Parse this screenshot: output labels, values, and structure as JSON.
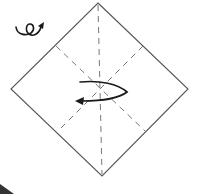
{
  "diagram": {
    "type": "origami-step",
    "paper": {
      "shape": "diamond",
      "vertices": {
        "top": [
          98,
          3
        ],
        "right": [
          188,
          89
        ],
        "bottom": [
          102,
          176
        ],
        "left": [
          11,
          89
        ]
      },
      "stroke": "#555555"
    },
    "creases": [
      {
        "name": "vertical-center-crease",
        "style": "valley-dashed",
        "from": [
          98,
          3
        ],
        "to": [
          102,
          176
        ]
      },
      {
        "name": "diagonal-crease-a",
        "style": "valley-dashed",
        "from": [
          56,
          46
        ],
        "to": [
          145,
          131
        ]
      },
      {
        "name": "diagonal-crease-b",
        "style": "valley-dashed",
        "from": [
          143,
          46
        ],
        "to": [
          58,
          131
        ]
      }
    ],
    "symbols": [
      {
        "name": "turn-over-icon",
        "meaning": "turn the model over",
        "position": [
          25,
          30
        ]
      },
      {
        "name": "fold-behind-arrow",
        "meaning": "fold/rotate in direction of arrow",
        "position": [
          100,
          92
        ]
      },
      {
        "name": "next-step-pointer",
        "meaning": "next step indicator",
        "position": [
          5,
          188
        ]
      }
    ],
    "colors": {
      "background": "#ffffff",
      "outline": "#555555",
      "crease": "#777777",
      "arrow": "#1a1a1a"
    },
    "label": "Origami step: turn over"
  }
}
